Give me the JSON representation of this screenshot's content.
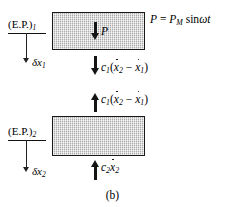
{
  "figure": {
    "caption": "(b)",
    "forcing_equation": "P = P_M sinωt",
    "forcing_equation_parts": {
      "lhs": "P",
      "equals": "=",
      "amplitude": "P",
      "amplitude_subscript": "M",
      "function": "sin",
      "omega": "ω",
      "time": "t"
    }
  },
  "mass_1": {
    "name": "upper-mass-block",
    "internal_force_label": "P",
    "internal_force_direction": "down",
    "equilibrium": {
      "label_text": "(E.P.)",
      "label_subscript": "1",
      "displacement_symbol": "δx",
      "displacement_subscript": "1",
      "arrow_direction": "down"
    },
    "damper_force_below": {
      "coefficient": "c",
      "coefficient_subscript": "1",
      "open_paren": "(",
      "term_1_var": "x",
      "term_1_sub": "2",
      "minus": "−",
      "term_2_var": "x",
      "term_2_sub": "1",
      "close_paren": ")",
      "arrow_direction": "down"
    }
  },
  "mass_2": {
    "name": "lower-mass-block",
    "equilibrium": {
      "label_text": "(E.P.)",
      "label_subscript": "2",
      "displacement_symbol": "δx",
      "displacement_subscript": "2",
      "arrow_direction": "down"
    },
    "damper_force_above": {
      "coefficient": "c",
      "coefficient_subscript": "1",
      "open_paren": "(",
      "term_1_var": "x",
      "term_1_sub": "2",
      "minus": "−",
      "term_2_var": "x",
      "term_2_sub": "1",
      "close_paren": ")",
      "arrow_direction": "up"
    },
    "damper_force_below": {
      "coefficient": "c",
      "coefficient_subscript": "2",
      "term_var": "x",
      "term_sub": "2",
      "arrow_direction": "up"
    }
  },
  "colors": {
    "block_fill": "#c9c9c9",
    "block_stroke": "#1a1a1a",
    "arrow": "#141414",
    "background": "#ffffff"
  }
}
